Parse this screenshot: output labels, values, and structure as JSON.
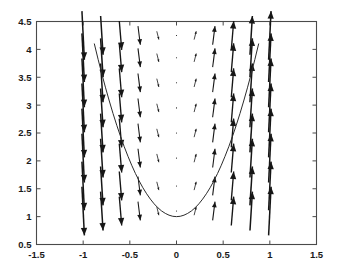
{
  "chart_data": {
    "type": "line",
    "title": "",
    "xlabel": "",
    "ylabel": "",
    "xlim": [
      -1.5,
      1.5
    ],
    "ylim": [
      0.5,
      4.5
    ],
    "xticks": [
      -1.5,
      -1,
      -0.5,
      0,
      0.5,
      1,
      1.5
    ],
    "xticklabels": [
      "-1.5",
      "-1",
      "-0.5",
      "0",
      "0.5",
      "1",
      "1.5"
    ],
    "yticks": [
      0.5,
      1,
      1.5,
      2,
      2.5,
      3,
      3.5,
      4,
      4.5
    ],
    "yticklabels": [
      "0.5",
      "1",
      "1.5",
      "2",
      "2.5",
      "3",
      "3.5",
      "4",
      "4.5"
    ],
    "grid": false,
    "legend": null,
    "series": [
      {
        "name": "solution-curve",
        "type": "line",
        "equation": "y = 4*x^2 + 1",
        "color": "#2b2b2b",
        "x": [
          -0.88,
          -0.84,
          -0.8,
          -0.76,
          -0.72,
          -0.68,
          -0.64,
          -0.6,
          -0.56,
          -0.52,
          -0.48,
          -0.44,
          -0.4,
          -0.36,
          -0.32,
          -0.28,
          -0.24,
          -0.2,
          -0.16,
          -0.12,
          -0.08,
          -0.04,
          0,
          0.04,
          0.08,
          0.12,
          0.16,
          0.2,
          0.24,
          0.28,
          0.32,
          0.36,
          0.4,
          0.44,
          0.48,
          0.52,
          0.56,
          0.6,
          0.64,
          0.68,
          0.72,
          0.76,
          0.8,
          0.84,
          0.88
        ],
        "y": [
          4.098,
          3.822,
          3.56,
          3.31,
          3.074,
          2.85,
          2.638,
          2.44,
          2.254,
          2.082,
          1.922,
          1.774,
          1.64,
          1.518,
          1.41,
          1.314,
          1.23,
          1.16,
          1.102,
          1.058,
          1.026,
          1.006,
          1.0,
          1.006,
          1.026,
          1.058,
          1.102,
          1.16,
          1.23,
          1.314,
          1.41,
          1.518,
          1.64,
          1.774,
          1.922,
          2.082,
          2.254,
          2.44,
          2.638,
          2.85,
          3.074,
          3.31,
          3.56,
          3.822,
          4.098
        ]
      }
    ],
    "vector_field": {
      "name": "slope-field-quiver",
      "description": "Direction field arrows for dy/dx = 8x scaled by magnitude",
      "color": "#161616",
      "grid_x": [
        -1,
        -0.8,
        -0.6,
        -0.4,
        -0.2,
        0,
        0.2,
        0.4,
        0.6,
        0.8,
        1
      ],
      "grid_y": [
        1.1,
        1.55,
        2.05,
        2.5,
        2.95,
        3.4,
        3.85,
        4.25
      ],
      "u_component": "1",
      "v_component": "8*x",
      "scale_factor": 0.055
    }
  },
  "axes": {
    "box_color": "#4a4a4a",
    "background": "#ffffff"
  }
}
